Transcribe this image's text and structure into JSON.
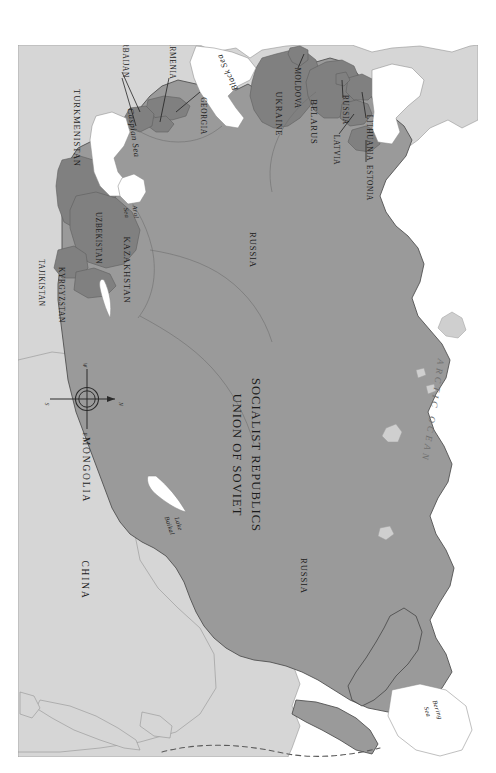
{
  "map": {
    "title": "UNION OF SOVIET SOCIALIST REPUBLICS",
    "title_line1": "UNION OF SOVIET",
    "title_line2": "SOCIALIST REPUBLICS",
    "orientation_note": "rotated-90-clockwise",
    "colors": {
      "background": "#ffffff",
      "ussr_fill": "#9a9a9a",
      "republic_fill": "#808080",
      "neighbor_fill": "#d6d6d6",
      "water_fill": "#ffffff",
      "border_stroke": "#6e6e6e",
      "outer_border_stroke": "#4a4a4a",
      "label_text": "#1b1b1b",
      "ocean_text": "#6f6f6f"
    },
    "soviet_republics": [
      {
        "name": "RUSSIA",
        "id": "russia"
      },
      {
        "name": "RUSSIA",
        "id": "russia-east"
      },
      {
        "name": "RUSSIA",
        "id": "russia-kaliningrad"
      },
      {
        "name": "UKRAINE",
        "id": "ukraine"
      },
      {
        "name": "BELARUS",
        "id": "belarus"
      },
      {
        "name": "MOLDOVA",
        "id": "moldova"
      },
      {
        "name": "LITHUANIA",
        "id": "lithuania"
      },
      {
        "name": "LATVIA",
        "id": "latvia"
      },
      {
        "name": "ESTONIA",
        "id": "estonia"
      },
      {
        "name": "GEORGIA",
        "id": "georgia"
      },
      {
        "name": "ARMENIA",
        "id": "armenia"
      },
      {
        "name": "AZERBAIJAN",
        "id": "azerbaijan"
      },
      {
        "name": "KAZAKHSTAN",
        "id": "kazakhstan"
      },
      {
        "name": "UZBEKISTAN",
        "id": "uzbekistan"
      },
      {
        "name": "TURKMENISTAN",
        "id": "turkmenistan"
      },
      {
        "name": "TAJIKISTAN",
        "id": "tajikistan"
      },
      {
        "name": "KYRGYZSTAN",
        "id": "kyrgyzstan"
      }
    ],
    "neighbors": [
      {
        "name": "MONGOLIA",
        "id": "mongolia"
      },
      {
        "name": "CHINA",
        "id": "china"
      }
    ],
    "water_bodies": [
      {
        "name": "Black Sea",
        "id": "black-sea"
      },
      {
        "name": "Caspian Sea",
        "id": "caspian-sea"
      },
      {
        "name": "Aral Sea",
        "id": "aral-sea",
        "line1": "Aral",
        "line2": "Sea"
      },
      {
        "name": "Lake Baikal",
        "id": "lake-baikal",
        "line1": "Lake",
        "line2": "Baikal"
      },
      {
        "name": "Bering Sea",
        "id": "bering-sea",
        "line1": "Bering",
        "line2": "Sea"
      },
      {
        "name": "ARCTIC OCEAN",
        "id": "arctic-ocean"
      }
    ],
    "compass": {
      "north": "N",
      "south": "S",
      "east": "E",
      "west": "W"
    }
  }
}
